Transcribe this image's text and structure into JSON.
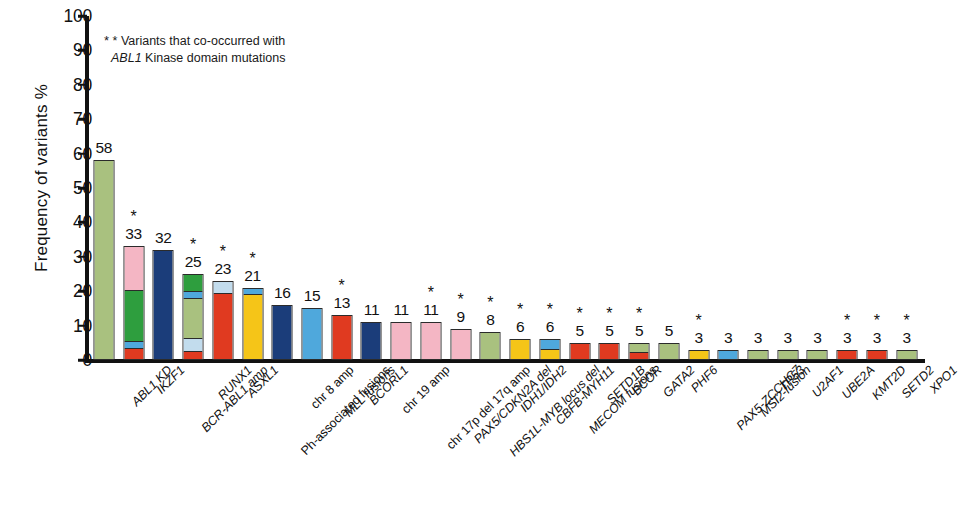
{
  "chart_data": {
    "type": "bar",
    "title": "",
    "subtitle": "",
    "xlabel": "",
    "ylabel": "Frequency of variants %",
    "ylim": [
      0,
      100
    ],
    "yticks": [
      0,
      10,
      20,
      30,
      40,
      50,
      60,
      70,
      80,
      90,
      100
    ],
    "grid": false,
    "legend": "none",
    "stacked": true,
    "annotation_line1": "* Variants that co-occurred with",
    "annotation_line2_italic": "ABL1",
    "annotation_line2_rest": " Kinase domain mutations",
    "star_symbol": "*",
    "categories": [
      "ABL1 KD",
      "IKZF1",
      "BCR-ABL1 amp",
      "RUNX1",
      "ASXL1",
      "Ph-associated fusions",
      "chr 8 amp",
      "MLL fusions",
      "BCORL1",
      "chr 19 amp",
      "chr 17p del 17q amp",
      "PAX5/CDKN2A del",
      "HBS1L-MYB locus del",
      "IDH1/IDH2",
      "CBFB-MYH11",
      "MECOM fusions",
      "SETD1B",
      "BCOR",
      "GATA2",
      "PHF6",
      "PAX5-ZCCHC7",
      "MSI2-fusion",
      "TP53",
      "U2AF1",
      "UBE2A",
      "KMT2D",
      "SETD2",
      "XPO1"
    ],
    "category_italic": [
      true,
      true,
      true,
      true,
      true,
      false,
      false,
      true,
      true,
      false,
      false,
      true,
      true,
      true,
      true,
      true,
      true,
      true,
      true,
      true,
      true,
      true,
      true,
      true,
      true,
      true,
      true,
      true
    ],
    "values": [
      58,
      33,
      32,
      25,
      23,
      21,
      16,
      15,
      13,
      11,
      11,
      11,
      9,
      8,
      6,
      6,
      5,
      5,
      5,
      5,
      3,
      3,
      3,
      3,
      3,
      3,
      3,
      3
    ],
    "starred": [
      false,
      true,
      false,
      true,
      true,
      true,
      false,
      false,
      true,
      false,
      false,
      true,
      true,
      true,
      true,
      true,
      true,
      true,
      true,
      false,
      true,
      false,
      false,
      false,
      false,
      true,
      true,
      true
    ],
    "stacks": [
      [
        {
          "v": 58,
          "c": "#a9c17f"
        }
      ],
      [
        {
          "v": 3,
          "c": "#e03a20"
        },
        {
          "v": 2,
          "c": "#4fa8dc"
        },
        {
          "v": 15,
          "c": "#2e9e3e"
        },
        {
          "v": 13,
          "c": "#f4b6c4"
        }
      ],
      [
        {
          "v": 32,
          "c": "#1b3d7a"
        }
      ],
      [
        {
          "v": 2,
          "c": "#e03a20"
        },
        {
          "v": 4,
          "c": "#c2dced"
        },
        {
          "v": 12,
          "c": "#a9c17f"
        },
        {
          "v": 2,
          "c": "#4fa8dc"
        },
        {
          "v": 5,
          "c": "#2e9e3e"
        }
      ],
      [
        {
          "v": 19.5,
          "c": "#e03a20"
        },
        {
          "v": 3.5,
          "c": "#c2dced"
        }
      ],
      [
        {
          "v": 19,
          "c": "#f5c518"
        },
        {
          "v": 2,
          "c": "#4fa8dc"
        }
      ],
      [
        {
          "v": 16,
          "c": "#1b3d7a"
        }
      ],
      [
        {
          "v": 15,
          "c": "#4fa8dc"
        }
      ],
      [
        {
          "v": 13,
          "c": "#e03a20"
        }
      ],
      [
        {
          "v": 11,
          "c": "#1b3d7a"
        }
      ],
      [
        {
          "v": 11,
          "c": "#f4b6c4"
        }
      ],
      [
        {
          "v": 11,
          "c": "#f4b6c4"
        }
      ],
      [
        {
          "v": 9,
          "c": "#f4b6c4"
        }
      ],
      [
        {
          "v": 8,
          "c": "#a9c17f"
        }
      ],
      [
        {
          "v": 6,
          "c": "#f5c518"
        }
      ],
      [
        {
          "v": 3,
          "c": "#f5c518"
        },
        {
          "v": 3,
          "c": "#4fa8dc"
        }
      ],
      [
        {
          "v": 5,
          "c": "#e03a20"
        }
      ],
      [
        {
          "v": 5,
          "c": "#e03a20"
        }
      ],
      [
        {
          "v": 2,
          "c": "#e03a20"
        },
        {
          "v": 3,
          "c": "#a9c17f"
        }
      ],
      [
        {
          "v": 5,
          "c": "#a9c17f"
        }
      ],
      [
        {
          "v": 3,
          "c": "#f5c518"
        }
      ],
      [
        {
          "v": 3,
          "c": "#4fa8dc"
        }
      ],
      [
        {
          "v": 3,
          "c": "#a9c17f"
        }
      ],
      [
        {
          "v": 3,
          "c": "#a9c17f"
        }
      ],
      [
        {
          "v": 3,
          "c": "#a9c17f"
        }
      ],
      [
        {
          "v": 3,
          "c": "#e03a20"
        }
      ],
      [
        {
          "v": 3,
          "c": "#e03a20"
        }
      ],
      [
        {
          "v": 3,
          "c": "#a9c17f"
        }
      ]
    ],
    "colors": {
      "sage_green": "#a9c17f",
      "red": "#e03a20",
      "light_blue": "#4fa8dc",
      "green": "#2e9e3e",
      "pink": "#f4b6c4",
      "navy": "#1b3d7a",
      "pale_blue": "#c2dced",
      "yellow": "#f5c518",
      "axis": "#111111"
    }
  }
}
